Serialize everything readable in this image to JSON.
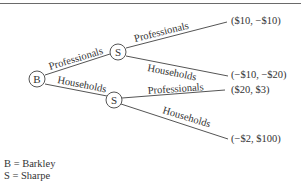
{
  "diagram": {
    "type": "game-tree",
    "nodes": {
      "root": {
        "label": "B"
      },
      "upper": {
        "label": "S"
      },
      "lower": {
        "label": "S"
      }
    },
    "edges": {
      "root_upper": "Professionals",
      "root_lower": "Households",
      "upper_top": "Professionals",
      "upper_bottom": "Households",
      "lower_top": "Professionals",
      "lower_bottom": "Households"
    },
    "payoffs": [
      "($10, −$10)",
      "(−$10, −$20)",
      "($20, $3)",
      "(−$2, $100)"
    ],
    "legend": [
      "B = Barkley",
      "S = Sharpe"
    ]
  }
}
